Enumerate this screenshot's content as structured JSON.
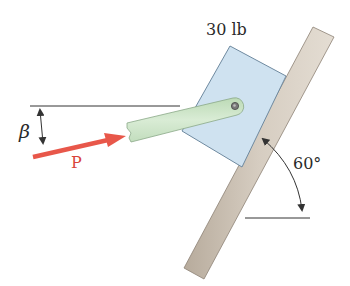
{
  "diagram": {
    "type": "statics-free-body",
    "labels": {
      "weight": "30 lb",
      "force": "P",
      "angle_symbol": "β",
      "incline_angle": "60°"
    },
    "components": {
      "block": {
        "name": "block",
        "weight": "30 lb",
        "color": "#cfe2f0"
      },
      "arm": {
        "name": "link-arm",
        "color": "#cde5c8"
      },
      "wall": {
        "name": "inclined-wall",
        "angle": "60°",
        "color": "#c9bfb2"
      },
      "force_arrow": {
        "name": "P",
        "color": "#e8574a"
      }
    },
    "colors": {
      "block_fill": "#cfe2f0",
      "block_edge": "#6f8aa0",
      "arm_fill": "#cde5c8",
      "arm_edge": "#8aa888",
      "wall_fill": "#c9bfb2",
      "wall_edge": "#8d8275",
      "force": "#e8574a",
      "lines": "#333333"
    }
  }
}
